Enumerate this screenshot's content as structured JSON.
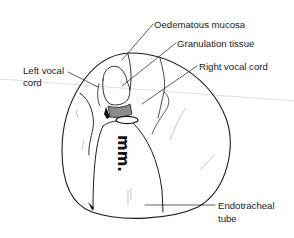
{
  "figure": {
    "type": "anatomical-line-drawing",
    "labels": {
      "oedematous_mucosa": "Oedematous mucosa",
      "granulation_tissue": "Granulation tissue",
      "left_vocal_cord_line1": "Left vocal",
      "left_vocal_cord_line2": "cord",
      "right_vocal_cord": "Right vocal cord",
      "endotracheal_tube_line1": "Endotracheal",
      "endotracheal_tube_line2": "tube"
    },
    "tube_marking": "mm.",
    "colors": {
      "ink": "#1a1a1a",
      "granulation_fill": "#8c8c8c",
      "background": "#ffffff"
    }
  }
}
